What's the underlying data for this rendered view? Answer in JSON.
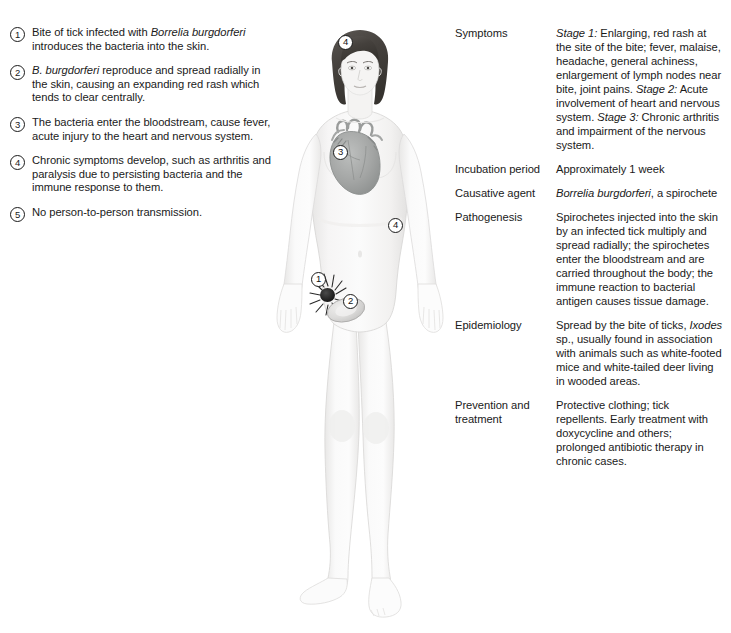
{
  "steps": [
    {
      "num": "1",
      "html": "Bite of tick infected with <i>Borrelia burgdorferi</i> introduces the bacteria into the skin."
    },
    {
      "num": "2",
      "html": "<i>B. burgdorferi</i> reproduce and spread radially in the skin, causing an expanding red rash which tends to clear centrally."
    },
    {
      "num": "3",
      "html": "The bacteria enter the bloodstream, cause fever, acute injury to the heart and nervous system."
    },
    {
      "num": "4",
      "html": "Chronic symptoms develop, such as arthritis and paralysis due to persisting bacteria and the immune response to them."
    },
    {
      "num": "5",
      "html": "No person-to-person transmission."
    }
  ],
  "figure": {
    "markers": [
      {
        "num": "4",
        "location": "forehead"
      },
      {
        "num": "3",
        "location": "heart"
      },
      {
        "num": "4",
        "location": "left-arm-elbow"
      },
      {
        "num": "1",
        "location": "tick-bite-hip"
      },
      {
        "num": "2",
        "location": "erythema-migrans-rash"
      }
    ],
    "colors": {
      "skin": "#f3f2f1",
      "skin_shadow": "#e4e3e2",
      "hair": "#4a4744",
      "heart": "#a7a9a8",
      "tick": "#1c1c1c",
      "rash": "#d3d3d2",
      "outline": "#c9c8c7"
    }
  },
  "info": {
    "rows": [
      {
        "label": "Symptoms",
        "html": "<i>Stage 1:</i> Enlarging, red rash at the site of the bite; fever, malaise, headache, general achiness, enlargement of lymph nodes near bite, joint pains. <i>Stage 2:</i> Acute involvement of heart and nervous system. <i>Stage 3:</i> Chronic arthritis and impairment of the nervous system."
      },
      {
        "label": "Incubation period",
        "html": "Approximately 1 week"
      },
      {
        "label": "Causative agent",
        "html": "<i>Borrelia burgdorferi</i>, a spirochete"
      },
      {
        "label": "Pathogenesis",
        "html": "Spirochetes injected into the skin by an infected tick multiply and spread radially; the spirochetes enter the bloodstream and are carried throughout the body; the immune reaction to bacterial antigen causes tissue damage."
      },
      {
        "label": "Epidemiology",
        "html": "Spread by the bite of ticks, <i>Ixodes</i> sp., usually found in association with animals such as white-footed mice and white-tailed deer living in wooded areas."
      },
      {
        "label": "Prevention and treatment",
        "html": "Protective clothing; tick repellents. Early treatment with doxycycline and others; prolonged antibiotic therapy in chronic cases."
      }
    ]
  }
}
